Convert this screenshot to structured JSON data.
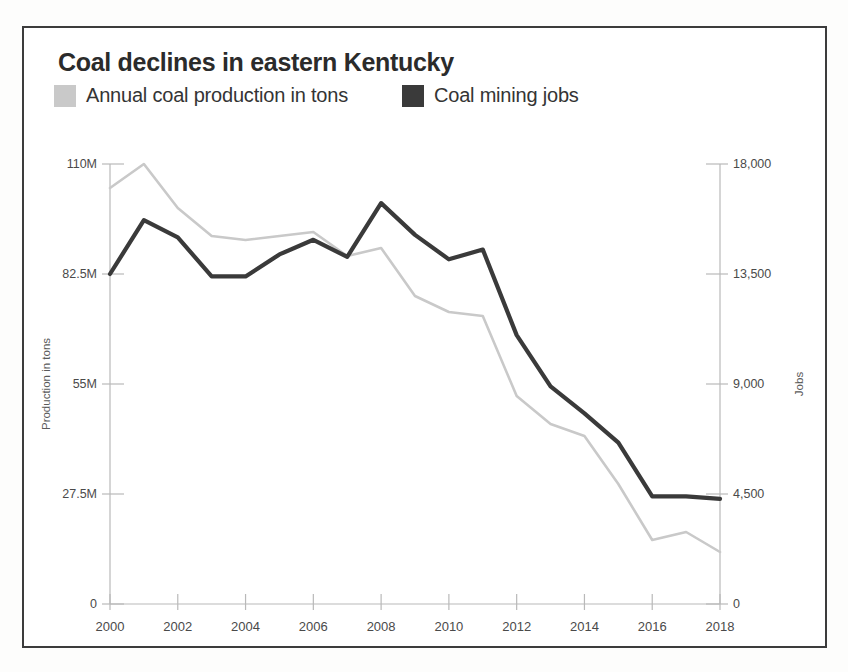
{
  "header": {
    "title": "Coal declines in eastern Kentucky"
  },
  "legend": {
    "position": "top-left",
    "items": [
      {
        "label": "Annual coal production in tons",
        "color": "#c9c9c9",
        "swatch_name": "legend-swatch-production"
      },
      {
        "label": "Coal mining jobs",
        "color": "#3a3a3a",
        "swatch_name": "legend-swatch-jobs"
      }
    ]
  },
  "axes": {
    "left": {
      "title": "Production in tons",
      "ticks": [
        "110M",
        "82.5M",
        "55M",
        "27.5M",
        "0"
      ],
      "values": [
        110000000,
        82500000,
        55000000,
        27500000,
        0
      ]
    },
    "right": {
      "title": "Jobs",
      "ticks": [
        "18,000",
        "13,500",
        "9,000",
        "4,500",
        "0"
      ],
      "values": [
        18000,
        13500,
        9000,
        4500,
        0
      ]
    },
    "bottom": {
      "ticks": [
        "2000",
        "2002",
        "2004",
        "2006",
        "2008",
        "2010",
        "2012",
        "2014",
        "2016",
        "2018"
      ]
    }
  },
  "colors": {
    "production_line": "#c9c9c9",
    "jobs_line": "#3a3a3a",
    "axis": "#b9b9b9",
    "text": "#343434",
    "frame": "#3c3c3c",
    "background": "#ffffff"
  },
  "chart_data": {
    "type": "line",
    "title": "Coal declines in eastern Kentucky",
    "xlabel": "",
    "ylabel": "Production in tons",
    "y2label": "Jobs",
    "grid": false,
    "legend_position": "top-left",
    "x": [
      2000,
      2001,
      2002,
      2003,
      2004,
      2005,
      2006,
      2007,
      2008,
      2009,
      2010,
      2011,
      2012,
      2013,
      2014,
      2015,
      2016,
      2017,
      2018
    ],
    "xlim": [
      2000,
      2018
    ],
    "ylim": [
      0,
      110000000
    ],
    "y2lim": [
      0,
      18000
    ],
    "xticks": [
      2000,
      2002,
      2004,
      2006,
      2008,
      2010,
      2012,
      2014,
      2016,
      2018
    ],
    "yticks": [
      0,
      27500000,
      55000000,
      82500000,
      110000000
    ],
    "y2ticks": [
      0,
      4500,
      9000,
      13500,
      18000
    ],
    "series": [
      {
        "name": "Annual coal production in tons",
        "axis": "left",
        "color": "#c9c9c9",
        "values": [
          104000000,
          110000000,
          99000000,
          92000000,
          91000000,
          92000000,
          93000000,
          87000000,
          89000000,
          77000000,
          73000000,
          72000000,
          52000000,
          45000000,
          42000000,
          30000000,
          16000000,
          18000000,
          13000000
        ]
      },
      {
        "name": "Coal mining jobs",
        "axis": "right",
        "color": "#3a3a3a",
        "values": [
          13500,
          15700,
          15000,
          13400,
          13400,
          14300,
          14900,
          14200,
          16400,
          15100,
          14100,
          14500,
          11000,
          8900,
          7800,
          6600,
          4400,
          4400,
          4300
        ]
      }
    ]
  }
}
